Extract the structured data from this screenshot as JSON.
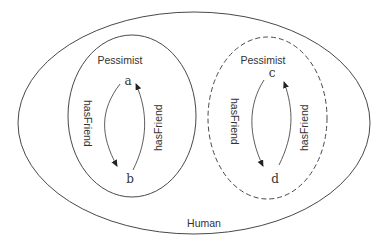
{
  "diagram": {
    "outer_class": {
      "label": "Human",
      "style": "solid"
    },
    "left_class": {
      "label": "Pessimist",
      "style": "solid"
    },
    "right_class": {
      "label": "Pessimist",
      "style": "dashed"
    },
    "individuals": [
      "a",
      "b",
      "c",
      "d"
    ],
    "edges": [
      {
        "from": "a",
        "to": "b",
        "label": "hasFriend"
      },
      {
        "from": "b",
        "to": "a",
        "label": "hasFriend"
      },
      {
        "from": "c",
        "to": "d",
        "label": "hasFriend"
      },
      {
        "from": "d",
        "to": "c",
        "label": "hasFriend"
      }
    ],
    "colors": {
      "stroke": "#333333",
      "background": "#ffffff"
    }
  }
}
